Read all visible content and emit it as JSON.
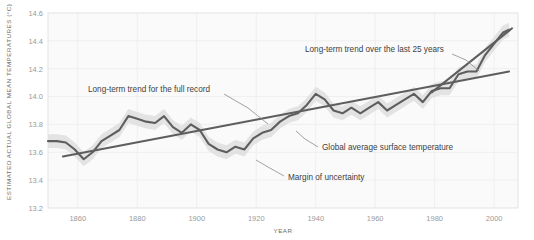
{
  "chart_data": {
    "type": "line",
    "title": "",
    "xlabel": "YEAR",
    "ylabel": "ESTIMATED ACTUAL GLOBAL MEAN TEMPERATURES (°C)",
    "xlim": [
      1850,
      2008
    ],
    "ylim": [
      13.2,
      14.6
    ],
    "xticks": [
      1860,
      1880,
      1900,
      1920,
      1940,
      1960,
      1980,
      2000
    ],
    "yticks": [
      13.2,
      13.4,
      13.6,
      13.8,
      14.0,
      14.2,
      14.4,
      14.6
    ],
    "grid": true,
    "legend": "none",
    "series": [
      {
        "name": "Global average surface temperature",
        "type": "line",
        "color": "#5e5e5e",
        "x": [
          1850,
          1853,
          1856,
          1859,
          1862,
          1865,
          1868,
          1871,
          1874,
          1877,
          1880,
          1883,
          1886,
          1889,
          1892,
          1895,
          1898,
          1901,
          1904,
          1907,
          1910,
          1913,
          1916,
          1919,
          1922,
          1925,
          1928,
          1931,
          1934,
          1937,
          1940,
          1943,
          1946,
          1949,
          1952,
          1955,
          1958,
          1961,
          1964,
          1967,
          1970,
          1973,
          1976,
          1979,
          1982,
          1985,
          1988,
          1991,
          1994,
          1997,
          2000,
          2003,
          2005
        ],
        "y": [
          13.68,
          13.68,
          13.67,
          13.62,
          13.55,
          13.6,
          13.68,
          13.72,
          13.76,
          13.86,
          13.84,
          13.82,
          13.81,
          13.86,
          13.78,
          13.74,
          13.8,
          13.76,
          13.66,
          13.62,
          13.6,
          13.64,
          13.62,
          13.7,
          13.74,
          13.76,
          13.82,
          13.86,
          13.88,
          13.94,
          14.02,
          13.98,
          13.9,
          13.88,
          13.92,
          13.88,
          13.92,
          13.96,
          13.9,
          13.94,
          13.98,
          14.02,
          13.96,
          14.04,
          14.06,
          14.06,
          14.16,
          14.18,
          14.18,
          14.3,
          14.38,
          14.46,
          14.48
        ]
      },
      {
        "name": "Margin of uncertainty",
        "type": "band",
        "color": "#dcdcdc",
        "half_width": 0.05
      },
      {
        "name": "Long-term trend for the full record",
        "type": "trend",
        "color": "#5e5e5e",
        "x": [
          1855,
          2005
        ],
        "y": [
          13.57,
          14.18
        ]
      },
      {
        "name": "Long-term trend over the last 25 years",
        "type": "trend",
        "color": "#5e5e5e",
        "x": [
          1979,
          2006
        ],
        "y": [
          14.03,
          14.49
        ]
      }
    ],
    "annotations": [
      {
        "label": "Long-term trend over the last 25 years",
        "x": 305,
        "y": 52,
        "leader": [
          [
            452,
            54
          ],
          [
            466,
            60
          ],
          [
            479,
            71
          ]
        ]
      },
      {
        "label": "Long-term trend for the full record",
        "x": 88,
        "y": 92,
        "leader": [
          [
            224,
            94
          ],
          [
            248,
            108
          ],
          [
            268,
            124
          ]
        ]
      },
      {
        "label": "Global average surface temperature",
        "x": 322,
        "y": 150,
        "leader": [
          [
            318,
            147
          ],
          [
            305,
            139
          ],
          [
            296,
            131
          ]
        ]
      },
      {
        "label": "Margin of uncertainty",
        "x": 288,
        "y": 180,
        "leader": [
          [
            284,
            176
          ],
          [
            268,
            167
          ],
          [
            256,
            160
          ]
        ]
      }
    ]
  }
}
